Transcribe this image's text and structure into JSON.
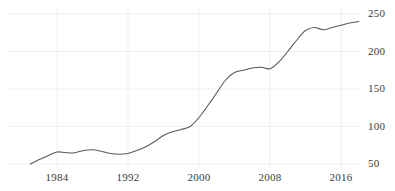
{
  "chart_data": {
    "type": "line",
    "title": "",
    "subtitle": "",
    "xlabel": "",
    "ylabel": "",
    "xlim": [
      1981,
      2018.5
    ],
    "ylim": [
      40,
      258
    ],
    "grid": true,
    "grid_axes": "both",
    "legend": null,
    "legend_position": "none",
    "y_ticks": [
      50,
      100,
      150,
      200,
      250
    ],
    "y_tick_labels": [
      "50",
      "100",
      "150",
      "200",
      "250"
    ],
    "y_axis_position": "right",
    "x_ticks": [
      1984,
      1992,
      2000,
      2008,
      2016
    ],
    "x_tick_labels": [
      "1984",
      "1992",
      "2000",
      "2008",
      "2016"
    ],
    "line_color": "#595959",
    "grid_color": "#f0f0f0",
    "series": [
      {
        "name": "series-1",
        "x": [
          1981,
          1982,
          1983,
          1984,
          1985,
          1986,
          1987,
          1988,
          1989,
          1990,
          1991,
          1992,
          1993,
          1994,
          1995,
          1996,
          1997,
          1998,
          1999,
          2000,
          2001,
          2002,
          2003,
          2004,
          2005,
          2006,
          2007,
          2008,
          2009,
          2010,
          2011,
          2012,
          2013,
          2014,
          2015,
          2016,
          2017,
          2018
        ],
        "values": [
          50,
          56,
          61,
          66,
          65,
          65,
          68,
          69,
          67,
          64,
          63,
          64,
          68,
          73,
          80,
          88,
          93,
          96,
          100,
          112,
          128,
          145,
          162,
          172,
          175,
          178,
          179,
          177,
          186,
          200,
          215,
          228,
          232,
          229,
          232,
          235,
          238,
          240
        ]
      }
    ]
  }
}
